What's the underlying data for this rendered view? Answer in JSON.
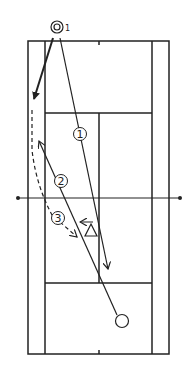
{
  "diagram": {
    "type": "tennis-drill",
    "colors": {
      "line": "#222222",
      "background": "#ffffff"
    },
    "player": {
      "symbol": "double-circle",
      "subscript": "1"
    },
    "opponent": {
      "symbol": "open-circle"
    },
    "coach": {
      "symbol": "triangle"
    },
    "steps": [
      {
        "label": "1",
        "style": "solid",
        "description": "shot from player to far baseline area"
      },
      {
        "label": "2",
        "style": "solid",
        "description": "return from opponent toward left alley"
      },
      {
        "label": "3",
        "style": "dashed",
        "description": "player movement toward net"
      }
    ]
  }
}
